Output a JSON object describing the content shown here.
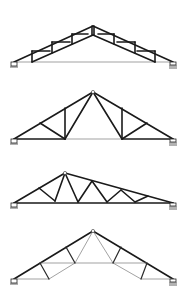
{
  "diagram": {
    "title": "",
    "colors": {
      "member": "#1a1a1a",
      "light_member": "#7a7a7a",
      "background": "#ffffff"
    },
    "trusses": [
      {
        "id": "truss-1",
        "type": "parallel-chord scissor / Howe-type with verticals",
        "span_px": [
          14,
          173
        ],
        "apex": [
          93,
          26
        ],
        "supports": [
          {
            "kind": "pin",
            "at": [
              14,
              62
            ]
          },
          {
            "kind": "roller",
            "at": [
              173,
              62
            ]
          }
        ]
      },
      {
        "id": "truss-2",
        "type": "Fan / Fink with vertical",
        "span_px": [
          14,
          173
        ],
        "apex": [
          93,
          92
        ],
        "supports": [
          {
            "kind": "pin",
            "at": [
              14,
              139
            ]
          },
          {
            "kind": "roller",
            "at": [
              173,
              139
            ]
          }
        ]
      },
      {
        "id": "truss-3",
        "type": "Asymmetric Warren / mono-pitch combination",
        "span_px": [
          14,
          173
        ],
        "apex": [
          65,
          173
        ],
        "supports": [
          {
            "kind": "pin",
            "at": [
              14,
              203
            ]
          },
          {
            "kind": "roller",
            "at": [
              173,
              203
            ]
          }
        ]
      },
      {
        "id": "truss-4",
        "type": "Scissor truss with ceiling tie",
        "span_px": [
          14,
          173
        ],
        "apex": [
          93,
          231
        ],
        "supports": [
          {
            "kind": "pin",
            "at": [
              14,
              279
            ]
          },
          {
            "kind": "roller",
            "at": [
              173,
              279
            ]
          }
        ]
      }
    ]
  }
}
